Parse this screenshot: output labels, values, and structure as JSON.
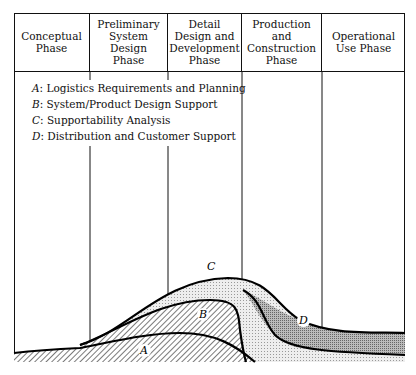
{
  "phases": [
    {
      "label": "Conceptual\nPhase",
      "lines": [
        "Conceptual",
        "Phase"
      ]
    },
    {
      "label": "Preliminary System Design Phase",
      "lines": [
        "Preliminary",
        "System Design",
        "Phase"
      ]
    },
    {
      "label": "Detail Design and Development Phase",
      "lines": [
        "Detail",
        "Design and",
        "Development",
        "Phase"
      ]
    },
    {
      "label": "Production and Construction Phase",
      "lines": [
        "Production and",
        "Construction",
        "Phase"
      ]
    },
    {
      "label": "Operational Use Phase",
      "lines": [
        "Operational",
        "Use Phase"
      ]
    }
  ],
  "legend": [
    {
      "key": "A",
      "text": ": Logistics Requirements and Planning"
    },
    {
      "key": "B",
      "text": ": System/Product Design Support"
    },
    {
      "key": "C",
      "text": ": Supportability Analysis"
    },
    {
      "key": "D",
      "text": ": Distribution and Customer Support"
    }
  ],
  "area_labels": {
    "A": "A",
    "B": "B",
    "C": "C",
    "D": "D"
  }
}
